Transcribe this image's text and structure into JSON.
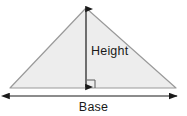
{
  "figure": {
    "name": "triangle-base-height-diagram",
    "width": 187,
    "height": 116,
    "background_color": "#ffffff",
    "labels": {
      "height": "Height",
      "base": "Base"
    },
    "colors": {
      "triangle_fill": "#ededed",
      "triangle_stroke": "#9a9a9a",
      "arrow_color": "#1a1a1a",
      "right_angle_color": "#5a5a5a",
      "text_color": "#1a1a1a"
    },
    "geometry": {
      "triangle": {
        "apex": [
          86,
          8
        ],
        "left_vertex": [
          10,
          88
        ],
        "right_vertex": [
          176,
          88
        ],
        "points": "86,8 10,88 176,88",
        "stroke_width": 1.2
      },
      "height_arrow": {
        "x": 86,
        "y_top": 9,
        "y_bottom": 87,
        "double_headed": true,
        "stroke_width": 1.2
      },
      "base_arrow": {
        "y": 96,
        "x_left": 9,
        "x_right": 177,
        "double_headed": true,
        "stroke_width": 1.2
      },
      "right_angle_marker": {
        "x": 87,
        "y": 80,
        "size": 8,
        "stroke_width": 1
      }
    }
  }
}
